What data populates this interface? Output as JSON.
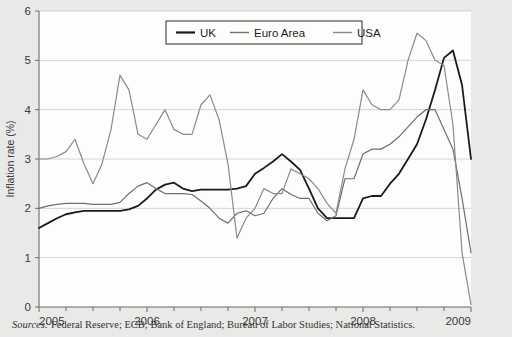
{
  "figure": {
    "background_color": "#e9e9e7",
    "plot_background_color": "#fdfdfc"
  },
  "source_note": {
    "label": "Sources:",
    "text": " Federal Reserve; ECB; Bank of England; Bureau of Labor Studies; National Statistics."
  },
  "chart_data": {
    "type": "line",
    "title": "",
    "subtitle": "",
    "xlabel": "",
    "ylabel": "Inflation rate (%)",
    "xlim": [
      2005,
      2009
    ],
    "ylim": [
      0,
      6
    ],
    "y_ticks": [
      0,
      1,
      2,
      3,
      4,
      5,
      6
    ],
    "y_tick_labels": [
      "0",
      "1",
      "2",
      "3",
      "4",
      "5",
      "6"
    ],
    "x_ticks": [
      2005,
      2006,
      2007,
      2008,
      2009
    ],
    "x_tick_labels": [
      "2005",
      "2006",
      "2007",
      "2008",
      "2009"
    ],
    "x_minor_tick_interval": 0.25,
    "grid": "horizontal",
    "legend_position": "top-center",
    "colors": {
      "uk": "#1a1a1a",
      "euro_area": "#6e6e6e",
      "usa": "#8a8a8a"
    },
    "series": [
      {
        "name": "UK",
        "color": "#1a1a1a",
        "line_width": 1.8,
        "x": [
          2005.0,
          2005.083,
          2005.167,
          2005.25,
          2005.333,
          2005.417,
          2005.5,
          2005.583,
          2005.667,
          2005.75,
          2005.833,
          2005.917,
          2006.0,
          2006.083,
          2006.167,
          2006.25,
          2006.333,
          2006.417,
          2006.5,
          2006.583,
          2006.667,
          2006.75,
          2006.833,
          2006.917,
          2007.0,
          2007.083,
          2007.167,
          2007.25,
          2007.333,
          2007.417,
          2007.5,
          2007.583,
          2007.667,
          2007.75,
          2007.833,
          2007.917,
          2008.0,
          2008.083,
          2008.167,
          2008.25,
          2008.333,
          2008.417,
          2008.5,
          2008.583,
          2008.667,
          2008.75,
          2008.833,
          2008.917,
          2009.0
        ],
        "values": [
          1.6,
          1.7,
          1.8,
          1.88,
          1.92,
          1.95,
          1.95,
          1.95,
          1.95,
          1.95,
          1.98,
          2.05,
          2.2,
          2.38,
          2.48,
          2.52,
          2.4,
          2.35,
          2.38,
          2.38,
          2.38,
          2.38,
          2.4,
          2.45,
          2.7,
          2.82,
          2.95,
          3.1,
          2.95,
          2.78,
          2.4,
          2.0,
          1.8,
          1.8,
          1.8,
          1.8,
          2.2,
          2.25,
          2.25,
          2.5,
          2.7,
          3.0,
          3.3,
          3.8,
          4.4,
          5.05,
          5.2,
          4.5,
          3.0
        ]
      },
      {
        "name": "Euro Area",
        "color": "#6e6e6e",
        "line_width": 1.2,
        "x": [
          2005.0,
          2005.083,
          2005.167,
          2005.25,
          2005.333,
          2005.417,
          2005.5,
          2005.583,
          2005.667,
          2005.75,
          2005.833,
          2005.917,
          2006.0,
          2006.083,
          2006.167,
          2006.25,
          2006.333,
          2006.417,
          2006.5,
          2006.583,
          2006.667,
          2006.75,
          2006.833,
          2006.917,
          2007.0,
          2007.083,
          2007.167,
          2007.25,
          2007.333,
          2007.417,
          2007.5,
          2007.583,
          2007.667,
          2007.75,
          2007.833,
          2007.917,
          2008.0,
          2008.083,
          2008.167,
          2008.25,
          2008.333,
          2008.417,
          2008.5,
          2008.583,
          2008.667,
          2008.75,
          2008.833,
          2008.917,
          2009.0
        ],
        "values": [
          2.0,
          2.05,
          2.08,
          2.1,
          2.1,
          2.1,
          2.08,
          2.08,
          2.08,
          2.12,
          2.3,
          2.45,
          2.52,
          2.4,
          2.3,
          2.3,
          2.3,
          2.28,
          2.15,
          2.0,
          1.8,
          1.7,
          1.9,
          1.95,
          1.85,
          1.9,
          2.2,
          2.4,
          2.28,
          2.2,
          2.2,
          1.9,
          1.75,
          1.85,
          2.6,
          2.6,
          3.1,
          3.2,
          3.2,
          3.3,
          3.45,
          3.65,
          3.85,
          4.0,
          4.0,
          3.6,
          3.2,
          2.2,
          1.1
        ]
      },
      {
        "name": "USA",
        "color": "#8a8a8a",
        "line_width": 1.2,
        "x": [
          2005.0,
          2005.083,
          2005.167,
          2005.25,
          2005.333,
          2005.417,
          2005.5,
          2005.583,
          2005.667,
          2005.75,
          2005.833,
          2005.917,
          2006.0,
          2006.083,
          2006.167,
          2006.25,
          2006.333,
          2006.417,
          2006.5,
          2006.583,
          2006.667,
          2006.75,
          2006.833,
          2006.917,
          2007.0,
          2007.083,
          2007.167,
          2007.25,
          2007.333,
          2007.417,
          2007.5,
          2007.583,
          2007.667,
          2007.75,
          2007.833,
          2007.917,
          2008.0,
          2008.083,
          2008.167,
          2008.25,
          2008.333,
          2008.417,
          2008.5,
          2008.583,
          2008.667,
          2008.75,
          2008.833,
          2008.917,
          2009.0
        ],
        "values": [
          3.0,
          3.0,
          3.05,
          3.15,
          3.4,
          2.9,
          2.5,
          2.9,
          3.6,
          4.7,
          4.4,
          3.5,
          3.4,
          3.7,
          4.0,
          3.6,
          3.5,
          3.5,
          4.1,
          4.3,
          3.8,
          2.9,
          1.4,
          1.8,
          2.0,
          2.4,
          2.3,
          2.3,
          2.8,
          2.7,
          2.6,
          2.4,
          2.1,
          1.9,
          2.8,
          3.4,
          4.4,
          4.1,
          4.0,
          4.0,
          4.2,
          5.0,
          5.55,
          5.4,
          5.0,
          4.9,
          3.7,
          1.1,
          0.05
        ]
      }
    ]
  },
  "legend": {
    "items": [
      {
        "label": "UK",
        "color": "#1a1a1a"
      },
      {
        "label": "Euro Area",
        "color": "#6e6e6e"
      },
      {
        "label": "USA",
        "color": "#8a8a8a"
      }
    ]
  }
}
